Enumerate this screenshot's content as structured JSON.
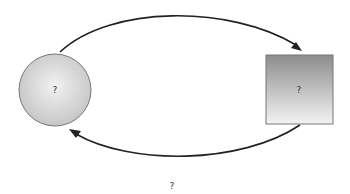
{
  "diagram": {
    "nodes": [
      {
        "id": "circle",
        "shape": "circle",
        "label": "?"
      },
      {
        "id": "square",
        "shape": "square",
        "label": "?"
      }
    ],
    "edges": [
      {
        "from": "circle",
        "to": "square",
        "direction": "top"
      },
      {
        "from": "square",
        "to": "circle",
        "direction": "bottom"
      }
    ],
    "caption": "?"
  }
}
